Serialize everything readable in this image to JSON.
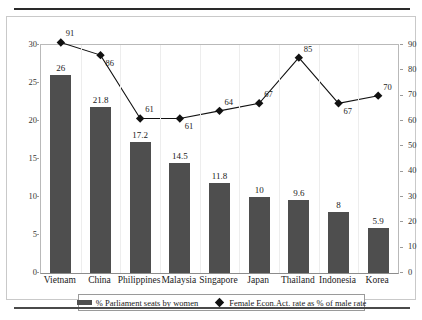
{
  "chart_data": {
    "type": "bar",
    "title": "",
    "subtitle": "",
    "xlabel": "",
    "ylabel": "",
    "grid": false,
    "legend_position": "bottom",
    "categories": [
      "Vietnam",
      "China",
      "Philippines",
      "Malaysia",
      "Singapore",
      "Japan",
      "Thailand",
      "Indonesia",
      "Korea"
    ],
    "series": [
      {
        "name": "% Parliament seats by women",
        "type": "bar",
        "axis": "left",
        "color": "#4e4e4e",
        "values": [
          26,
          21.8,
          17.2,
          14.5,
          11.8,
          10,
          9.6,
          8,
          5.9
        ],
        "value_labels": [
          "26",
          "21.8",
          "17.2",
          "14.5",
          "11.8",
          "10",
          "9.6",
          "8",
          "5.9"
        ]
      },
      {
        "name": "Female Econ.Act. rate as % of male rate",
        "type": "line",
        "axis": "right",
        "color": "#111111",
        "marker": "diamond",
        "values": [
          91,
          86,
          61,
          61,
          64,
          67,
          85,
          67,
          70
        ],
        "value_labels": [
          "91",
          "86",
          "61",
          "61",
          "64",
          "67",
          "85",
          "67",
          "70"
        ]
      }
    ],
    "left_axis": {
      "ticks": [
        "0",
        "5",
        "10",
        "15",
        "20",
        "25",
        "30"
      ],
      "min": 0,
      "max": 30
    },
    "right_axis": {
      "ticks": [
        "0",
        "10",
        "20",
        "30",
        "40",
        "50",
        "60",
        "70",
        "80",
        "90"
      ],
      "min": 0,
      "max": 90
    }
  },
  "legend": {
    "entries": [
      {
        "label": "% Parliament seats by women",
        "marker": "bar-swatch"
      },
      {
        "label": "Female Econ.Act. rate as % of male rate",
        "marker": "diamond-swatch"
      }
    ]
  }
}
